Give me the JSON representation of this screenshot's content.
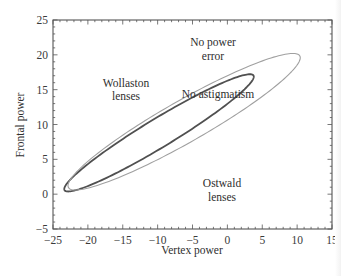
{
  "chart_data": {
    "type": "line",
    "title": "",
    "xlabel": "Vertex power",
    "ylabel": "Frontal power",
    "xlim": [
      -25,
      15
    ],
    "ylim": [
      -5,
      25
    ],
    "xticks": [
      -25,
      -20,
      -15,
      -10,
      -5,
      0,
      5,
      10,
      15
    ],
    "yticks": [
      -5,
      0,
      5,
      10,
      15,
      20,
      25
    ],
    "xtick_labels": [
      "−25",
      "−20",
      "−15",
      "−10",
      "−5",
      "0",
      "5",
      "10",
      "15"
    ],
    "ytick_labels": [
      "−5",
      "0",
      "5",
      "10",
      "15",
      "20",
      "25"
    ],
    "grid": false,
    "legend": null,
    "series": [
      {
        "name": "No astigmatism",
        "shape": "closed ellipse",
        "color": "#505050",
        "line_width": 1.8,
        "center": [
          -9.8,
          8.8
        ],
        "extremes": {
          "left": [
            -22.6,
            2.0
          ],
          "right": [
            3.0,
            15.6
          ],
          "top": [
            1.8,
            17.5
          ],
          "bottom": [
            -18.0,
            0.0
          ]
        }
      },
      {
        "name": "No power error",
        "shape": "closed ellipse",
        "color": "#a0a0a0",
        "line_width": 1.1,
        "center": [
          -6.2,
          10.4
        ],
        "extremes": {
          "left": [
            -21.7,
            3.9
          ],
          "right": [
            9.4,
            17.8
          ],
          "top": [
            8.2,
            20.9
          ],
          "bottom": [
            -16.0,
            0.0
          ]
        }
      }
    ],
    "annotations": [
      {
        "text_lines": [
          "No power",
          "error"
        ],
        "x": 3.0,
        "y": 21.0
      },
      {
        "text_lines": [
          "Wollaston",
          "lenses"
        ],
        "x": -15.5,
        "y": 15.0
      },
      {
        "text_lines": [
          "No astigmatism"
        ],
        "x": -1.5,
        "y": 12.8
      },
      {
        "text_lines": [
          "Ostwald",
          "lenses"
        ],
        "x": 0.0,
        "y": -1.8
      }
    ]
  },
  "labels": {
    "xlabel": "Vertex power",
    "ylabel": "Frontal power",
    "annot_no_power_1": "No power",
    "annot_no_power_2": "error",
    "annot_wollaston_1": "Wollaston",
    "annot_wollaston_2": "lenses",
    "annot_no_astig": "No astigmatism",
    "annot_ostwald_1": "Ostwald",
    "annot_ostwald_2": "lenses"
  }
}
